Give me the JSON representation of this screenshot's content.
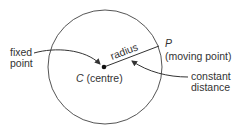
{
  "diagram": {
    "type": "circle-definition",
    "colors": {
      "stroke": "#333333",
      "text": "#333333",
      "background": "#ffffff"
    },
    "circle": {
      "cx": 105,
      "cy": 67,
      "r": 57
    },
    "centre": {
      "x": 104,
      "y": 67,
      "letter": "C",
      "suffix": " (centre)"
    },
    "point_p": {
      "x": 159,
      "y": 46,
      "letter": "P",
      "description": "(moving point)"
    },
    "radius_label": "radius",
    "labels": {
      "fixed_point": [
        "fixed",
        "point"
      ],
      "constant_distance": [
        "constant",
        "distance"
      ]
    }
  }
}
